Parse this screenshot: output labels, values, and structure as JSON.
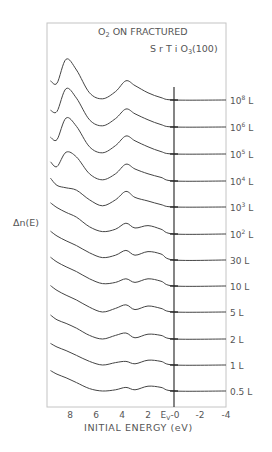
{
  "chart_data": {
    "type": "line",
    "title_line1": "O2 ON FRACTURED",
    "title_line2": "SrTiO3(100)",
    "title_parts": {
      "o": "O",
      "o_sub": "2",
      "rest1": " ON FRACTURED",
      "sr_ti_o": "S r T i O",
      "o3_sub": "3",
      "face": "(100)"
    },
    "xlabel": "INITIAL ENERGY (eV)",
    "ylabel": "Δn(E)",
    "x_reversed": true,
    "xlim": [
      9.5,
      -4
    ],
    "x_ticks": [
      8,
      6,
      4,
      2,
      0,
      -2,
      -4
    ],
    "x_tick_labels": [
      "8",
      "6",
      "4",
      "2",
      "Eᵥ-0",
      "-2",
      "-4"
    ],
    "ev_marker": {
      "label": "E",
      "sub": "V",
      "value": 0
    },
    "grid": false,
    "legend_position": "right, inline labels per trace",
    "series": [
      {
        "name": "10^8 L",
        "label_base": "10",
        "label_exp": "8",
        "label_unit": "L",
        "baseline_y": 100,
        "x": [
          9.5,
          9.0,
          8.3,
          7.5,
          6.5,
          5.5,
          4.5,
          3.7,
          3.0,
          2.0,
          1.0,
          0.0,
          -4.0
        ],
        "y": [
          1.6,
          1.4,
          3.4,
          2.5,
          0.6,
          0.1,
          0.7,
          1.6,
          1.2,
          0.6,
          0.2,
          0.0,
          0.0
        ]
      },
      {
        "name": "10^6 L",
        "label_base": "10",
        "label_exp": "6",
        "label_unit": "L",
        "baseline_y": 127,
        "x": [
          9.5,
          9.0,
          8.3,
          7.5,
          6.5,
          5.5,
          4.5,
          3.7,
          3.0,
          2.0,
          1.0,
          0.0,
          -4.0
        ],
        "y": [
          1.4,
          1.3,
          3.2,
          2.4,
          0.6,
          0.1,
          0.7,
          1.5,
          1.1,
          0.6,
          0.2,
          0.0,
          0.0
        ]
      },
      {
        "name": "10^5 L",
        "label_base": "10",
        "label_exp": "5",
        "label_unit": "L",
        "baseline_y": 154,
        "x": [
          9.5,
          9.0,
          8.3,
          7.5,
          6.5,
          5.5,
          4.5,
          3.7,
          3.0,
          2.0,
          1.0,
          0.0,
          -4.0
        ],
        "y": [
          1.4,
          1.2,
          3.0,
          2.3,
          0.6,
          0.1,
          0.7,
          1.5,
          1.1,
          0.6,
          0.2,
          0.0,
          0.0
        ]
      },
      {
        "name": "10^4 L",
        "label_base": "10",
        "label_exp": "4",
        "label_unit": "L",
        "baseline_y": 181,
        "x": [
          9.5,
          9.0,
          8.3,
          7.5,
          6.5,
          5.5,
          4.5,
          3.7,
          3.0,
          2.0,
          1.0,
          0.0,
          -4.0
        ],
        "y": [
          1.6,
          1.2,
          2.4,
          2.0,
          0.6,
          0.1,
          0.6,
          1.4,
          1.0,
          0.6,
          0.3,
          0.0,
          0.0
        ]
      },
      {
        "name": "10^3 L",
        "label_base": "10",
        "label_exp": "3",
        "label_unit": "L",
        "baseline_y": 207,
        "x": [
          9.5,
          9.0,
          8.3,
          7.5,
          6.5,
          5.5,
          4.5,
          3.7,
          3.0,
          2.0,
          1.0,
          0.0,
          -4.0
        ],
        "y": [
          2.4,
          1.8,
          1.6,
          1.4,
          0.6,
          0.1,
          0.6,
          1.3,
          0.8,
          0.5,
          0.2,
          0.0,
          0.0
        ]
      },
      {
        "name": "10^2 L",
        "label_base": "10",
        "label_exp": "2",
        "label_unit": "L",
        "baseline_y": 234,
        "x": [
          9.5,
          9.0,
          8.3,
          7.5,
          6.5,
          5.5,
          4.5,
          3.7,
          3.0,
          2.0,
          1.0,
          0.0,
          -4.0
        ],
        "y": [
          2.6,
          2.2,
          1.8,
          1.4,
          0.6,
          0.2,
          0.4,
          0.9,
          0.5,
          0.7,
          0.4,
          0.0,
          0.0
        ]
      },
      {
        "name": "30 L",
        "label_base": "30",
        "label_exp": "",
        "label_unit": "L",
        "baseline_y": 260,
        "x": [
          9.5,
          9.0,
          8.3,
          7.5,
          6.5,
          5.5,
          4.5,
          3.7,
          3.0,
          2.0,
          1.0,
          0.0,
          -4.0
        ],
        "y": [
          2.4,
          2.0,
          1.6,
          1.2,
          0.6,
          0.2,
          0.4,
          0.8,
          0.4,
          0.7,
          0.5,
          0.0,
          0.0
        ]
      },
      {
        "name": "10 L",
        "label_base": "10",
        "label_exp": "",
        "label_unit": "L",
        "baseline_y": 286,
        "x": [
          9.5,
          9.0,
          8.3,
          7.5,
          6.5,
          5.5,
          4.5,
          3.7,
          3.0,
          2.0,
          1.0,
          0.0,
          -4.0
        ],
        "y": [
          2.4,
          2.0,
          1.6,
          1.2,
          0.6,
          0.2,
          0.3,
          0.6,
          0.3,
          0.6,
          0.4,
          0.0,
          0.0
        ]
      },
      {
        "name": "5 L",
        "label_base": "5",
        "label_exp": "",
        "label_unit": "L",
        "baseline_y": 312,
        "x": [
          9.5,
          9.0,
          8.3,
          7.5,
          6.5,
          5.5,
          4.5,
          3.7,
          3.0,
          2.0,
          1.0,
          0.0,
          -4.0
        ],
        "y": [
          2.2,
          1.8,
          1.4,
          1.0,
          0.4,
          0.0,
          0.3,
          0.6,
          0.2,
          0.5,
          0.3,
          0.0,
          0.0
        ]
      },
      {
        "name": "2 L",
        "label_base": "2",
        "label_exp": "",
        "label_unit": "L",
        "baseline_y": 339,
        "x": [
          9.5,
          9.0,
          8.3,
          7.5,
          6.5,
          5.5,
          4.5,
          3.7,
          3.0,
          2.0,
          1.0,
          0.0,
          -4.0
        ],
        "y": [
          2.0,
          1.6,
          1.3,
          0.9,
          0.3,
          0.0,
          0.3,
          0.5,
          0.1,
          0.4,
          0.3,
          0.0,
          0.0
        ]
      },
      {
        "name": "1 L",
        "label_base": "1",
        "label_exp": "",
        "label_unit": "L",
        "baseline_y": 365,
        "x": [
          9.5,
          9.0,
          8.3,
          7.5,
          6.5,
          5.5,
          4.5,
          3.7,
          3.0,
          2.0,
          1.0,
          0.0,
          -4.0
        ],
        "y": [
          1.8,
          1.5,
          1.2,
          0.8,
          0.3,
          0.0,
          0.2,
          0.3,
          0.1,
          0.4,
          0.3,
          0.0,
          0.0
        ]
      },
      {
        "name": "0.5 L",
        "label_base": "0.5",
        "label_exp": "",
        "label_unit": "L",
        "baseline_y": 391,
        "x": [
          9.5,
          9.0,
          8.3,
          7.5,
          6.5,
          5.5,
          4.5,
          3.7,
          3.0,
          2.0,
          1.0,
          0.0,
          -4.0
        ],
        "y": [
          1.7,
          1.4,
          1.1,
          0.7,
          0.2,
          0.0,
          0.1,
          0.3,
          0.1,
          0.4,
          0.3,
          0.0,
          0.0
        ]
      }
    ]
  },
  "layout": {
    "frame": {
      "left": 47,
      "top": 23,
      "right": 226,
      "bottom": 407
    },
    "ev_line_x": 174,
    "px_per_ev": 13,
    "px_per_unit_y": 12,
    "line_color": "#444444",
    "frame_color": "#bbbbbb"
  }
}
